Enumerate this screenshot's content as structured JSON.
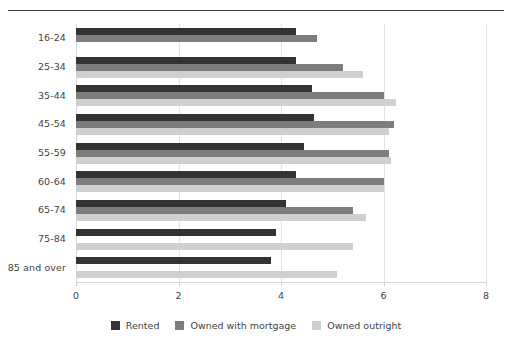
{
  "chart_data": {
    "type": "bar",
    "orientation": "horizontal",
    "title": "",
    "subtitle": "",
    "xlabel": "",
    "ylabel": "",
    "xlim": [
      0,
      8
    ],
    "xticks": [
      0,
      2,
      4,
      6,
      8
    ],
    "xtick_labels": [
      "0",
      "2",
      "4",
      "6",
      "8"
    ],
    "grid": true,
    "grid_axis": "x",
    "legend_position": "bottom",
    "categories": [
      "16-24",
      "25-34",
      "35-44",
      "45-54",
      "55-59",
      "60-64",
      "65-74",
      "75-84",
      "85 and over"
    ],
    "series": [
      {
        "name": "Rented",
        "color": "#333333",
        "values": [
          4.3,
          4.3,
          4.6,
          4.65,
          4.45,
          4.3,
          4.1,
          3.9,
          3.8
        ]
      },
      {
        "name": "Owned with mortgage",
        "color": "#7d7d7d",
        "values": [
          4.7,
          5.2,
          6.0,
          6.2,
          6.1,
          6.0,
          5.4,
          0,
          0
        ]
      },
      {
        "name": "Owned outright",
        "color": "#cfcfcf",
        "values": [
          0,
          5.6,
          6.25,
          6.1,
          6.15,
          6.0,
          5.65,
          5.4,
          5.1
        ]
      }
    ]
  },
  "legend": {
    "items": [
      {
        "label": "Rented",
        "color": "#333333"
      },
      {
        "label": "Owned with mortgage",
        "color": "#7d7d7d"
      },
      {
        "label": "Owned outright",
        "color": "#cfcfcf"
      }
    ]
  },
  "colors": {
    "background": "#ffffff",
    "text": "#3f3f3f",
    "rule": "#3a3a3a",
    "gridline": "#e2e2e2",
    "axis": "#d5d5d5"
  }
}
